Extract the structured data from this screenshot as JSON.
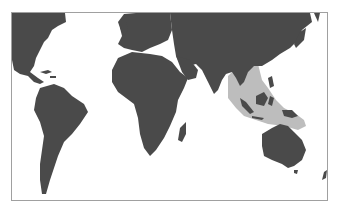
{
  "map": {
    "type": "world-distribution-map",
    "projection": "equirectangular (cropped)",
    "colors": {
      "land": "#4a4a4a",
      "range_highlight": "#bdbdbd",
      "ocean": "#ffffff",
      "frame": "#a0a0a0"
    },
    "highlighted_region": "Southeast Asia, Indonesia, Philippines, New Guinea and northern Australian coast"
  }
}
